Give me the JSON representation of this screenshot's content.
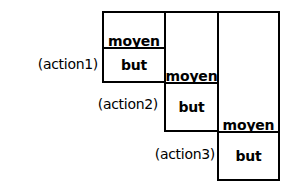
{
  "diagram": {
    "colors": {
      "stroke": "#000000",
      "background": "#ffffff",
      "text": "#000000"
    },
    "columns": [
      {
        "id": "column-1",
        "cells": [
          {
            "id": "cell-1-moyen",
            "label": "moyen"
          },
          {
            "id": "cell-1-but",
            "label": "but"
          }
        ]
      },
      {
        "id": "column-2",
        "cells": [
          {
            "id": "cell-2-moyen",
            "label": "moyen"
          },
          {
            "id": "cell-2-but",
            "label": "but"
          }
        ]
      },
      {
        "id": "column-3",
        "cells": [
          {
            "id": "cell-3-moyen",
            "label": "moyen"
          },
          {
            "id": "cell-3-but",
            "label": "but"
          }
        ]
      }
    ],
    "action_labels": [
      {
        "id": "action-1",
        "label": "(action1)"
      },
      {
        "id": "action-2",
        "label": "(action2)"
      },
      {
        "id": "action-3",
        "label": "(action3)"
      }
    ]
  }
}
